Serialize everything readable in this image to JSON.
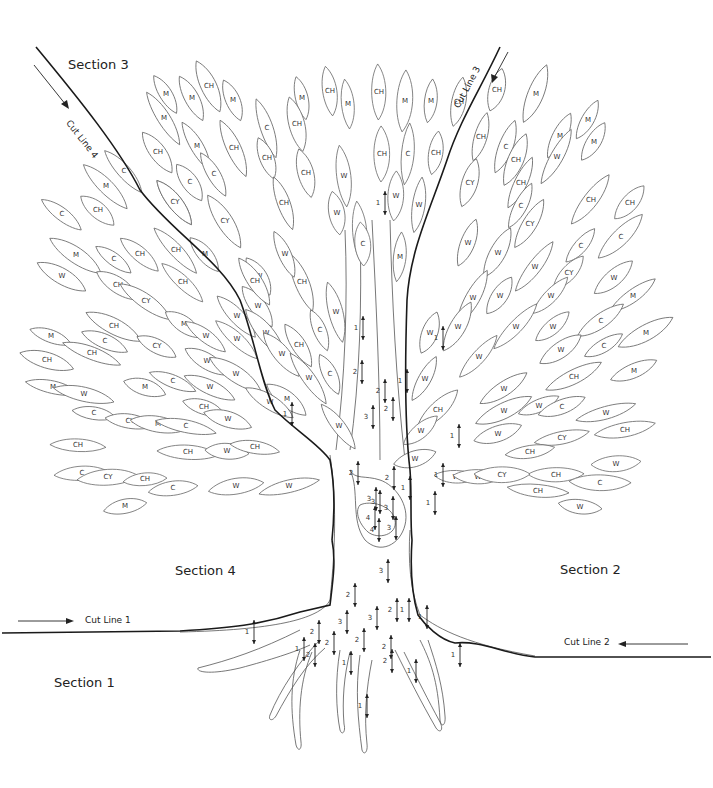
{
  "diagram": {
    "type": "intarsia tree pattern",
    "sections": [
      {
        "id": "section-1",
        "label": "Section 1",
        "x": 54,
        "y": 675
      },
      {
        "id": "section-2",
        "label": "Section 2",
        "x": 560,
        "y": 562
      },
      {
        "id": "section-3",
        "label": "Section 3",
        "x": 68,
        "y": 57
      },
      {
        "id": "section-4",
        "label": "Section 4",
        "x": 175,
        "y": 563
      }
    ],
    "cut_lines": [
      {
        "id": "cut-line-1",
        "label": "Cut Line 1",
        "x": 85,
        "y": 615,
        "rotate": 0
      },
      {
        "id": "cut-line-2",
        "label": "Cut Line 2",
        "x": 564,
        "y": 637,
        "rotate": 0
      },
      {
        "id": "cut-line-3",
        "label": "Cut Line 3",
        "x": 455,
        "y": 110,
        "rotate": -62
      },
      {
        "id": "cut-line-4",
        "label": "Cut Line 4",
        "x": 68,
        "y": 130,
        "rotate": 52
      }
    ],
    "legend_codes": [
      "M",
      "CH",
      "C",
      "CY",
      "W"
    ],
    "leaves": [
      {
        "code": "M",
        "x": 166,
        "y": 94
      },
      {
        "code": "M",
        "x": 192,
        "y": 98
      },
      {
        "code": "CH",
        "x": 209,
        "y": 86
      },
      {
        "code": "M",
        "x": 164,
        "y": 118
      },
      {
        "code": "M",
        "x": 233,
        "y": 100
      },
      {
        "code": "CH",
        "x": 158,
        "y": 152
      },
      {
        "code": "M",
        "x": 197,
        "y": 146
      },
      {
        "code": "CH",
        "x": 234,
        "y": 148
      },
      {
        "code": "C",
        "x": 190,
        "y": 182
      },
      {
        "code": "C",
        "x": 214,
        "y": 174
      },
      {
        "code": "CY",
        "x": 175,
        "y": 202
      },
      {
        "code": "CY",
        "x": 225,
        "y": 221
      },
      {
        "code": "M",
        "x": 302,
        "y": 98
      },
      {
        "code": "CH",
        "x": 330,
        "y": 91
      },
      {
        "code": "CH",
        "x": 297,
        "y": 124
      },
      {
        "code": "C",
        "x": 267,
        "y": 128
      },
      {
        "code": "CH",
        "x": 267,
        "y": 158
      },
      {
        "code": "CH",
        "x": 306,
        "y": 173
      },
      {
        "code": "CH",
        "x": 284,
        "y": 203
      },
      {
        "code": "W",
        "x": 344,
        "y": 176
      },
      {
        "code": "W",
        "x": 337,
        "y": 213
      },
      {
        "code": "M",
        "x": 348,
        "y": 104
      },
      {
        "code": "CH",
        "x": 379,
        "y": 92
      },
      {
        "code": "M",
        "x": 405,
        "y": 101
      },
      {
        "code": "M",
        "x": 431,
        "y": 101
      },
      {
        "code": "CH",
        "x": 459,
        "y": 102
      },
      {
        "code": "CH",
        "x": 382,
        "y": 154
      },
      {
        "code": "C",
        "x": 408,
        "y": 154
      },
      {
        "code": "CH",
        "x": 436,
        "y": 153
      },
      {
        "code": "W",
        "x": 396,
        "y": 196
      },
      {
        "code": "W",
        "x": 419,
        "y": 205
      },
      {
        "code": "W",
        "x": 360,
        "y": 232
      },
      {
        "code": "CH",
        "x": 497,
        "y": 90
      },
      {
        "code": "CH",
        "x": 481,
        "y": 137
      },
      {
        "code": "C",
        "x": 506,
        "y": 147
      },
      {
        "code": "M",
        "x": 536,
        "y": 94
      },
      {
        "code": "M",
        "x": 588,
        "y": 120
      },
      {
        "code": "M",
        "x": 560,
        "y": 136
      },
      {
        "code": "CH",
        "x": 516,
        "y": 160
      },
      {
        "code": "W",
        "x": 557,
        "y": 157
      },
      {
        "code": "M",
        "x": 594,
        "y": 142
      },
      {
        "code": "CY",
        "x": 470,
        "y": 183
      },
      {
        "code": "CH",
        "x": 521,
        "y": 183
      },
      {
        "code": "CH",
        "x": 591,
        "y": 200
      },
      {
        "code": "CH",
        "x": 630,
        "y": 203
      },
      {
        "code": "C",
        "x": 521,
        "y": 206
      },
      {
        "code": "CY",
        "x": 530,
        "y": 224
      },
      {
        "code": "C",
        "x": 621,
        "y": 237
      },
      {
        "code": "C",
        "x": 581,
        "y": 246
      },
      {
        "code": "W",
        "x": 468,
        "y": 243
      },
      {
        "code": "W",
        "x": 498,
        "y": 253
      },
      {
        "code": "W",
        "x": 535,
        "y": 267
      },
      {
        "code": "CY",
        "x": 569,
        "y": 273
      },
      {
        "code": "W",
        "x": 614,
        "y": 278
      },
      {
        "code": "M",
        "x": 633,
        "y": 296
      },
      {
        "code": "W",
        "x": 473,
        "y": 298
      },
      {
        "code": "W",
        "x": 500,
        "y": 296
      },
      {
        "code": "W",
        "x": 551,
        "y": 296
      },
      {
        "code": "C",
        "x": 601,
        "y": 321
      },
      {
        "code": "M",
        "x": 646,
        "y": 333
      },
      {
        "code": "C",
        "x": 604,
        "y": 346
      },
      {
        "code": "M",
        "x": 634,
        "y": 371
      },
      {
        "code": "W",
        "x": 458,
        "y": 327
      },
      {
        "code": "W",
        "x": 516,
        "y": 327
      },
      {
        "code": "W",
        "x": 553,
        "y": 327
      },
      {
        "code": "W",
        "x": 561,
        "y": 350
      },
      {
        "code": "W",
        "x": 479,
        "y": 357
      },
      {
        "code": "CH",
        "x": 574,
        "y": 377
      },
      {
        "code": "W",
        "x": 430,
        "y": 333
      },
      {
        "code": "W",
        "x": 425,
        "y": 379
      },
      {
        "code": "W",
        "x": 504,
        "y": 389
      },
      {
        "code": "W",
        "x": 504,
        "y": 411
      },
      {
        "code": "W",
        "x": 539,
        "y": 406
      },
      {
        "code": "C",
        "x": 562,
        "y": 407
      },
      {
        "code": "CH",
        "x": 438,
        "y": 410
      },
      {
        "code": "W",
        "x": 606,
        "y": 413
      },
      {
        "code": "W",
        "x": 421,
        "y": 431
      },
      {
        "code": "W",
        "x": 498,
        "y": 434
      },
      {
        "code": "CY",
        "x": 562,
        "y": 438
      },
      {
        "code": "CH",
        "x": 625,
        "y": 430
      },
      {
        "code": "W",
        "x": 415,
        "y": 459
      },
      {
        "code": "CH",
        "x": 530,
        "y": 452
      },
      {
        "code": "CH",
        "x": 556,
        "y": 475
      },
      {
        "code": "C",
        "x": 600,
        "y": 483
      },
      {
        "code": "W",
        "x": 456,
        "y": 477
      },
      {
        "code": "W",
        "x": 478,
        "y": 477
      },
      {
        "code": "CY",
        "x": 502,
        "y": 475
      },
      {
        "code": "CH",
        "x": 538,
        "y": 491
      },
      {
        "code": "W",
        "x": 580,
        "y": 507
      },
      {
        "code": "W",
        "x": 616,
        "y": 464
      },
      {
        "code": "C",
        "x": 124,
        "y": 171
      },
      {
        "code": "M",
        "x": 106,
        "y": 186
      },
      {
        "code": "CH",
        "x": 98,
        "y": 210
      },
      {
        "code": "C",
        "x": 62,
        "y": 214
      },
      {
        "code": "CY",
        "x": 175,
        "y": 202
      },
      {
        "code": "M",
        "x": 76,
        "y": 255
      },
      {
        "code": "C",
        "x": 114,
        "y": 259
      },
      {
        "code": "CH",
        "x": 140,
        "y": 254
      },
      {
        "code": "W",
        "x": 62,
        "y": 276
      },
      {
        "code": "CH",
        "x": 176,
        "y": 250
      },
      {
        "code": "M",
        "x": 205,
        "y": 254
      },
      {
        "code": "CH",
        "x": 118,
        "y": 285
      },
      {
        "code": "CH",
        "x": 183,
        "y": 282
      },
      {
        "code": "CY",
        "x": 146,
        "y": 301
      },
      {
        "code": "M",
        "x": 184,
        "y": 324
      },
      {
        "code": "W",
        "x": 206,
        "y": 336
      },
      {
        "code": "W",
        "x": 237,
        "y": 316
      },
      {
        "code": "CH",
        "x": 114,
        "y": 326
      },
      {
        "code": "M",
        "x": 51,
        "y": 336
      },
      {
        "code": "C",
        "x": 105,
        "y": 341
      },
      {
        "code": "CH",
        "x": 47,
        "y": 360
      },
      {
        "code": "CH",
        "x": 92,
        "y": 353
      },
      {
        "code": "CY",
        "x": 157,
        "y": 346
      },
      {
        "code": "W",
        "x": 207,
        "y": 361
      },
      {
        "code": "M",
        "x": 53,
        "y": 387
      },
      {
        "code": "W",
        "x": 84,
        "y": 394
      },
      {
        "code": "M",
        "x": 145,
        "y": 387
      },
      {
        "code": "C",
        "x": 173,
        "y": 381
      },
      {
        "code": "W",
        "x": 210,
        "y": 387
      },
      {
        "code": "W",
        "x": 236,
        "y": 374
      },
      {
        "code": "C",
        "x": 94,
        "y": 413
      },
      {
        "code": "CY",
        "x": 130,
        "y": 421
      },
      {
        "code": "M",
        "x": 158,
        "y": 424
      },
      {
        "code": "C",
        "x": 186,
        "y": 426
      },
      {
        "code": "CH",
        "x": 204,
        "y": 407
      },
      {
        "code": "W",
        "x": 228,
        "y": 419
      },
      {
        "code": "CH",
        "x": 78,
        "y": 445
      },
      {
        "code": "CH",
        "x": 188,
        "y": 452
      },
      {
        "code": "W",
        "x": 227,
        "y": 451
      },
      {
        "code": "CH",
        "x": 255,
        "y": 447
      },
      {
        "code": "C",
        "x": 82,
        "y": 473
      },
      {
        "code": "CY",
        "x": 108,
        "y": 477
      },
      {
        "code": "CH",
        "x": 145,
        "y": 479
      },
      {
        "code": "C",
        "x": 173,
        "y": 488
      },
      {
        "code": "W",
        "x": 236,
        "y": 486
      },
      {
        "code": "W",
        "x": 289,
        "y": 486
      },
      {
        "code": "M",
        "x": 125,
        "y": 506
      },
      {
        "code": "W",
        "x": 258,
        "y": 306
      },
      {
        "code": "W",
        "x": 237,
        "y": 339
      },
      {
        "code": "CH",
        "x": 302,
        "y": 282
      },
      {
        "code": "W",
        "x": 259,
        "y": 276
      },
      {
        "code": "W",
        "x": 285,
        "y": 254
      },
      {
        "code": "CH",
        "x": 255,
        "y": 281
      },
      {
        "code": "W",
        "x": 266,
        "y": 333
      },
      {
        "code": "C",
        "x": 320,
        "y": 330
      },
      {
        "code": "CH",
        "x": 299,
        "y": 345
      },
      {
        "code": "W",
        "x": 282,
        "y": 354
      },
      {
        "code": "W",
        "x": 309,
        "y": 378
      },
      {
        "code": "C",
        "x": 330,
        "y": 374
      },
      {
        "code": "M",
        "x": 287,
        "y": 399
      },
      {
        "code": "W",
        "x": 339,
        "y": 426
      },
      {
        "code": "W",
        "x": 336,
        "y": 312
      },
      {
        "code": "C",
        "x": 363,
        "y": 244
      },
      {
        "code": "M",
        "x": 400,
        "y": 257
      },
      {
        "code": "W",
        "x": 270,
        "y": 402
      }
    ],
    "grain_numbers": [
      {
        "n": "1",
        "x": 378,
        "y": 203
      },
      {
        "n": "1",
        "x": 356,
        "y": 328
      },
      {
        "n": "2",
        "x": 355,
        "y": 372
      },
      {
        "n": "3",
        "x": 366,
        "y": 417
      },
      {
        "n": "2",
        "x": 378,
        "y": 391
      },
      {
        "n": "2",
        "x": 386,
        "y": 409
      },
      {
        "n": "1",
        "x": 400,
        "y": 381
      },
      {
        "n": "1",
        "x": 285,
        "y": 414
      },
      {
        "n": "1",
        "x": 436,
        "y": 338
      },
      {
        "n": "1",
        "x": 452,
        "y": 436
      },
      {
        "n": "1",
        "x": 428,
        "y": 503
      },
      {
        "n": "2",
        "x": 351,
        "y": 473
      },
      {
        "n": "2",
        "x": 387,
        "y": 478
      },
      {
        "n": "1",
        "x": 403,
        "y": 488
      },
      {
        "n": "3",
        "x": 369,
        "y": 499
      },
      {
        "n": "3",
        "x": 373,
        "y": 502
      },
      {
        "n": "4",
        "x": 368,
        "y": 518
      },
      {
        "n": "4",
        "x": 372,
        "y": 530
      },
      {
        "n": "3",
        "x": 389,
        "y": 528
      },
      {
        "n": "3",
        "x": 386,
        "y": 508
      },
      {
        "n": "1",
        "x": 436,
        "y": 475
      },
      {
        "n": "3",
        "x": 381,
        "y": 571
      },
      {
        "n": "2",
        "x": 348,
        "y": 595
      },
      {
        "n": "2",
        "x": 312,
        "y": 632
      },
      {
        "n": "3",
        "x": 340,
        "y": 622
      },
      {
        "n": "2",
        "x": 327,
        "y": 643
      },
      {
        "n": "2",
        "x": 357,
        "y": 640
      },
      {
        "n": "3",
        "x": 370,
        "y": 618
      },
      {
        "n": "2",
        "x": 390,
        "y": 610
      },
      {
        "n": "1",
        "x": 402,
        "y": 610
      },
      {
        "n": "2",
        "x": 384,
        "y": 647
      },
      {
        "n": "2",
        "x": 385,
        "y": 661
      },
      {
        "n": "1",
        "x": 247,
        "y": 632
      },
      {
        "n": "1",
        "x": 297,
        "y": 649
      },
      {
        "n": "2",
        "x": 308,
        "y": 655
      },
      {
        "n": "1",
        "x": 344,
        "y": 663
      },
      {
        "n": "1",
        "x": 360,
        "y": 706
      },
      {
        "n": "1",
        "x": 409,
        "y": 671
      },
      {
        "n": "1",
        "x": 453,
        "y": 655
      },
      {
        "n": "1",
        "x": 420,
        "y": 617
      }
    ]
  }
}
